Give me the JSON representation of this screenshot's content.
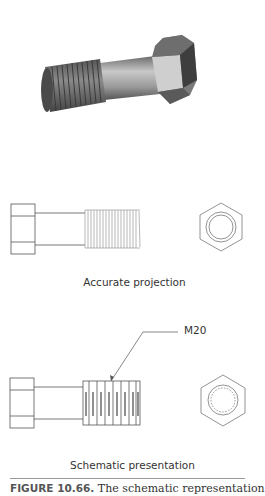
{
  "figure": {
    "number_label": "FIGURE 10.66.",
    "caption_text": " The schematic representation"
  },
  "views": {
    "render_3d": {
      "description": "3D shaded hex bolt with threaded shank"
    },
    "accurate": {
      "label": "Accurate projection"
    },
    "schematic": {
      "label": "Schematic presentation",
      "callout": "M20"
    }
  },
  "colors": {
    "line": "#555555",
    "thread_line": "#9a9a9a",
    "bolt_dark": "#4a4a4a",
    "bolt_mid": "#8a8a8a",
    "bolt_light": "#d0d0d0",
    "rule": "#9a9a9a"
  }
}
